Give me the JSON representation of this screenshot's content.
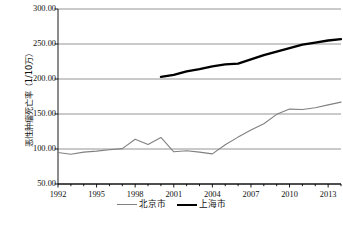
{
  "chart_data": {
    "type": "line",
    "title": "",
    "xlabel": "",
    "ylabel": "恶性肿瘤死亡率（1/10万）",
    "xlim": [
      1992,
      2014
    ],
    "ylim": [
      50,
      300
    ],
    "ytick_values": [
      50,
      100,
      150,
      200,
      250,
      300
    ],
    "ytick_labels": [
      "50.00",
      "100.00",
      "150.00",
      "200.00",
      "250.00",
      "300.00"
    ],
    "xtick_values": [
      1992,
      1995,
      1998,
      2001,
      2004,
      2007,
      2010,
      2013
    ],
    "xtick_labels": [
      "1992",
      "1995",
      "1998",
      "2001",
      "2004",
      "2007",
      "2010",
      "2013"
    ],
    "minor_xticks_every": 1,
    "grid": "horizontal",
    "legend_position": "bottom-center",
    "x": [
      1992,
      1993,
      1994,
      1995,
      1996,
      1997,
      1998,
      1999,
      2000,
      2001,
      2002,
      2003,
      2004,
      2005,
      2006,
      2007,
      2008,
      2009,
      2010,
      2011,
      2012,
      2013,
      2014
    ],
    "series": [
      {
        "name": "北京市",
        "color": "#808080",
        "line_width": 1.1,
        "values": [
          95.0,
          92.5,
          95.5,
          97.0,
          99.0,
          100.5,
          114.0,
          106.5,
          116.5,
          96.0,
          97.5,
          95.5,
          93.0,
          106.0,
          117.0,
          127.0,
          136.0,
          149.5,
          157.0,
          156.5,
          159.0,
          163.0,
          167.0
        ]
      },
      {
        "name": "上海市",
        "color": "#000000",
        "line_width": 2.3,
        "values": [
          null,
          null,
          null,
          null,
          null,
          null,
          null,
          null,
          203.0,
          206.0,
          211.0,
          214.0,
          218.0,
          221.0,
          222.0,
          228.0,
          234.0,
          239.0,
          244.0,
          249.0,
          252.0,
          255.0,
          257.0
        ]
      }
    ]
  },
  "legend": {
    "items": [
      {
        "label": "北京市",
        "style": "thin"
      },
      {
        "label": "上海市",
        "style": "thick"
      }
    ]
  },
  "axis": {
    "y_title": "恶性肿瘤死亡率（1/10万）"
  }
}
